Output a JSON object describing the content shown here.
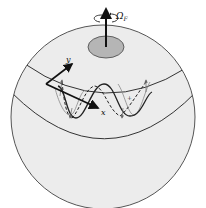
{
  "diagram": {
    "labels": {
      "rotation": "Ω",
      "rotation_sub": "F",
      "x_axis": "x",
      "y_axis": "y",
      "plus": "+",
      "minus1": "−",
      "minus2": "−"
    },
    "colors": {
      "background": "#ffffff",
      "sphere_fill": "#ececec",
      "sphere_stroke": "#555555",
      "cap_fill": "#b5b5b5",
      "ink": "#111111",
      "wave_light": "#888888"
    }
  }
}
